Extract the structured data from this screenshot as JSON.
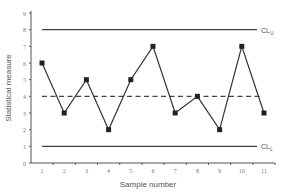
{
  "chart_data": {
    "type": "line",
    "title": "",
    "xlabel": "Sample number",
    "ylabel": "Statistical measure",
    "categories": [
      1,
      2,
      3,
      4,
      5,
      6,
      7,
      8,
      9,
      10,
      11
    ],
    "series": [
      {
        "name": "Statistical measure",
        "values": [
          6,
          3,
          5,
          2,
          5,
          7,
          3,
          4,
          2,
          7,
          3
        ],
        "marker": "square",
        "color": "#333333"
      }
    ],
    "reference_lines": [
      {
        "name": "CL_U",
        "label": "CL",
        "subscript": "U",
        "value": 8,
        "style": "solid"
      },
      {
        "name": "Center line",
        "label": "",
        "value": 4,
        "style": "dashed"
      },
      {
        "name": "CL_L",
        "label": "CL",
        "subscript": "L",
        "value": 1,
        "style": "solid"
      }
    ],
    "x_ticks": [
      "1",
      "2",
      "3",
      "4",
      "5",
      "6",
      "7",
      "8",
      "9",
      "10",
      "11"
    ],
    "y_ticks": [
      "0",
      "1",
      "2",
      "3",
      "4",
      "5",
      "6",
      "7",
      "8",
      "9"
    ],
    "ylim": [
      0,
      9
    ],
    "xlim": [
      0.6,
      11.4
    ],
    "grid": false,
    "legend": "none"
  }
}
